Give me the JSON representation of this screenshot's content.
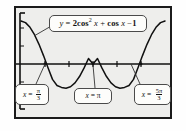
{
  "figure": {
    "kind": "graphing-calculator-screen",
    "background_color": "#eeeeec",
    "bezel_color": "#1b1b1b"
  },
  "equation_callout": {
    "name": "equation-label",
    "text": "y = 2 cos² x + cos x − 1",
    "lhs": "y",
    "equals": "=",
    "coefficient": "2",
    "term1": "cos",
    "exponent": "2",
    "var1": "x",
    "plus": "+",
    "term2": "cos",
    "var2": "x",
    "minus": "−",
    "constant": "1"
  },
  "root_callouts": [
    {
      "label_var": "x",
      "label_eq": "=",
      "value_text": "π/3",
      "numerator": "π",
      "denominator": "3",
      "is_fraction": true,
      "whole": ""
    },
    {
      "label_var": "x",
      "label_eq": "=",
      "value_text": "π",
      "numerator": "",
      "denominator": "",
      "is_fraction": false,
      "whole": "π"
    },
    {
      "label_var": "x",
      "label_eq": "=",
      "value_text": "5π/3",
      "numerator": "5π",
      "denominator": "3",
      "is_fraction": true,
      "whole": ""
    }
  ],
  "chart_data": {
    "type": "line",
    "xlabel": "x",
    "ylabel": "y",
    "xlim": [
      0,
      6.283185307179586
    ],
    "ylim": [
      -1.5,
      2.2
    ],
    "grid": false,
    "legend": "none",
    "axis_color": "#111111",
    "curve_color": "#111111",
    "x_tick_values": [
      1.0471975512,
      2.0943951024,
      3.1415926536,
      4.1887902048,
      5.235987756
    ],
    "x_tick_labels": [
      "π/3",
      "2π/3",
      "π",
      "4π/3",
      "5π/3"
    ],
    "y_tick_values": [
      -1,
      1,
      2
    ],
    "y_tick_labels": [
      "-1",
      "1",
      "2"
    ],
    "roots": [
      {
        "x": 1.0471975512,
        "y": 0,
        "label": "x = π/3"
      },
      {
        "x": 3.1415926536,
        "y": 0,
        "label": "x = π"
      },
      {
        "x": 5.235987756,
        "y": 0,
        "label": "x = 5π/3"
      }
    ],
    "minima": [
      {
        "x": 1.8234765819,
        "y": -1.125
      },
      {
        "x": 4.4597087253,
        "y": -1.125
      }
    ],
    "maxima": [
      {
        "x": 0.0,
        "y": 2.0
      },
      {
        "x": 3.1415926536,
        "y": 0.0
      },
      {
        "x": 6.2831853072,
        "y": 2.0
      }
    ],
    "series": [
      {
        "name": "y = 2 cos² x + cos x − 1",
        "x": [
          0,
          0.1963,
          0.3927,
          0.589,
          0.7854,
          0.9817,
          1.1781,
          1.3744,
          1.5708,
          1.7671,
          1.9635,
          2.1598,
          2.3562,
          2.5525,
          2.7489,
          2.9452,
          3.1416,
          3.3379,
          3.5343,
          3.7306,
          3.927,
          4.1233,
          4.3197,
          4.516,
          4.7124,
          4.9087,
          5.1051,
          5.3014,
          5.4978,
          5.6941,
          5.8905,
          6.0868,
          6.2832
        ],
        "y": [
          2.0,
          1.9243,
          1.7071,
          1.3629,
          0.9142,
          0.3909,
          -0.1698,
          -0.7153,
          -1.0,
          -1.0884,
          -1.1238,
          -1.0601,
          -0.8787,
          -0.5826,
          -0.1936,
          0.2546,
          0.0,
          0.2546,
          -0.1936,
          -0.5826,
          -0.8787,
          -1.0601,
          -1.1238,
          -1.0884,
          -1.0,
          -0.7153,
          -0.1698,
          0.3909,
          0.9142,
          1.3629,
          1.7071,
          1.9243,
          2.0
        ]
      }
    ]
  }
}
